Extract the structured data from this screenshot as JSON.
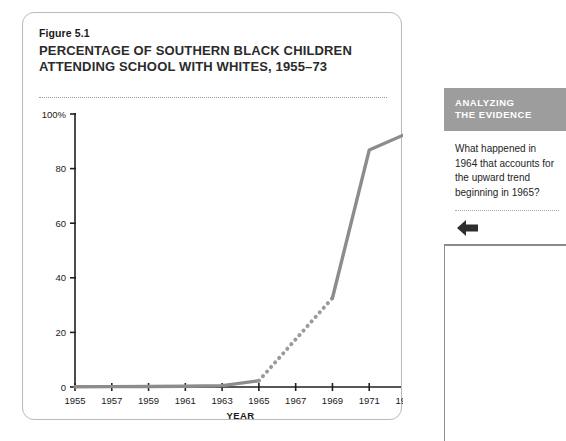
{
  "figure": {
    "number": "Figure 5.1",
    "title": "PERCENTAGE OF SOUTHERN BLACK CHILDREN ATTENDING SCHOOL WITH WHITES, 1955–73"
  },
  "sidebar": {
    "header_line1": "ANALYZING",
    "header_line2": "THE EVIDENCE",
    "question": "What happened in 1964 that accounts for the upward trend beginning in 1965?",
    "arrow_icon": "arrow-left-icon",
    "header_bg": "#9d9d9d",
    "header_text_color": "#ffffff"
  },
  "chart_data": {
    "type": "line",
    "title": "PERCENTAGE OF SOUTHERN BLACK CHILDREN ATTENDING SCHOOL WITH WHITES, 1955–73",
    "xlabel": "YEAR",
    "ylabel": "",
    "x": [
      1955,
      1957,
      1959,
      1961,
      1963,
      1965,
      1969,
      1971,
      1973
    ],
    "values": [
      0.1,
      0.15,
      0.2,
      0.25,
      0.5,
      2.3,
      32.6,
      86.8,
      92.7
    ],
    "xlim": [
      1955,
      1973
    ],
    "ylim": [
      0,
      100
    ],
    "xticks": [
      1955,
      1957,
      1959,
      1961,
      1963,
      1965,
      1967,
      1969,
      1971,
      1973
    ],
    "xtick_labels": [
      "1955",
      "1957",
      "1959",
      "1961",
      "1963",
      "1965",
      "1967",
      "1969",
      "1971",
      "1973"
    ],
    "yticks": [
      0,
      20,
      40,
      60,
      80,
      100
    ],
    "ytick_labels": [
      "0",
      "20",
      "40",
      "60",
      "80",
      "100%"
    ],
    "grid": false,
    "legend": "none",
    "series": [
      {
        "name": "Percentage attending school with whites",
        "style": "solid",
        "color": "#8c8c8c",
        "x": [
          1955,
          1957,
          1959,
          1961,
          1963,
          1965
        ],
        "values": [
          0.1,
          0.15,
          0.2,
          0.25,
          0.5,
          2.3
        ]
      },
      {
        "name": "Interpolated segment 1965–1969",
        "style": "dotted",
        "color": "#9a9a9a",
        "x": [
          1965,
          1969
        ],
        "values": [
          2.3,
          32.6
        ]
      },
      {
        "name": "Percentage attending school with whites (1969–73)",
        "style": "solid",
        "color": "#8c8c8c",
        "x": [
          1969,
          1971,
          1973
        ],
        "values": [
          32.6,
          86.8,
          92.7
        ]
      }
    ],
    "annotations": []
  }
}
